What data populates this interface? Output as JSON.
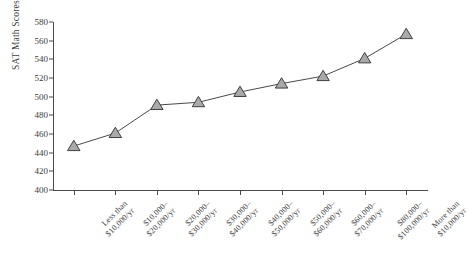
{
  "chart_data": {
    "type": "line",
    "title": "",
    "xlabel": "",
    "ylabel": "SAT Math Scores",
    "ylim": [
      400,
      580
    ],
    "yticks": [
      400,
      420,
      440,
      460,
      480,
      500,
      520,
      540,
      560,
      580
    ],
    "grid": false,
    "legend": null,
    "marker": "triangle",
    "marker_fill": "#a9a9a9",
    "marker_edge": "#3f3f3f",
    "line_color": "#4a4a4a",
    "categories": [
      "Less than $10,000/yr",
      "$10,000–$20,000/yr",
      "$20,000–$30,000/yr",
      "$30,000–$40,000/yr",
      "$40,000–$50,000/yr",
      "$50,000–$60,000/yr",
      "$60,000–$70,000/yr",
      "$80,000–$100,000/yr",
      "More than $10,000/yr"
    ],
    "category_lines": [
      [
        "Less than",
        "$10,000/yr"
      ],
      [
        "$10,000–",
        "$20,000/yr"
      ],
      [
        "$20,000–",
        "$30,000/yr"
      ],
      [
        "$30,000–",
        "$40,000/yr"
      ],
      [
        "$40,000–",
        "$50,000/yr"
      ],
      [
        "$50,000–",
        "$60,000/yr"
      ],
      [
        "$60,000–",
        "$70,000/yr"
      ],
      [
        "$80,000–",
        "$100,000/yr"
      ],
      [
        "More than",
        "$10,000/yr"
      ]
    ],
    "values": [
      447,
      461,
      491,
      494,
      505,
      514,
      522,
      541,
      567
    ]
  }
}
